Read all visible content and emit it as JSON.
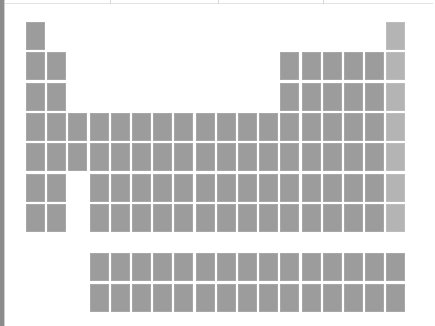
{
  "window": {
    "top_dividers_x": [
      110,
      218,
      323
    ]
  },
  "periodic_table": {
    "colors": {
      "element": "#9c9c9c",
      "noble_gas": "#b4b4b4",
      "background": "#ffffff"
    },
    "layout": {
      "x0": 26,
      "y0": 22,
      "col_pitch": 21.2,
      "row_pitch": 30.3,
      "fblock_y0": 253,
      "fblock_row_pitch": 30.5,
      "fblock_col_start": 4
    },
    "rows": [
      {
        "period": 1,
        "columns": [
          1,
          18
        ]
      },
      {
        "period": 2,
        "columns": [
          1,
          2,
          13,
          14,
          15,
          16,
          17,
          18
        ]
      },
      {
        "period": 3,
        "columns": [
          1,
          2,
          13,
          14,
          15,
          16,
          17,
          18
        ]
      },
      {
        "period": 4,
        "columns": [
          1,
          2,
          3,
          4,
          5,
          6,
          7,
          8,
          9,
          10,
          11,
          12,
          13,
          14,
          15,
          16,
          17,
          18
        ]
      },
      {
        "period": 5,
        "columns": [
          1,
          2,
          3,
          4,
          5,
          6,
          7,
          8,
          9,
          10,
          11,
          12,
          13,
          14,
          15,
          16,
          17,
          18
        ]
      },
      {
        "period": 6,
        "columns": [
          1,
          2,
          4,
          5,
          6,
          7,
          8,
          9,
          10,
          11,
          12,
          13,
          14,
          15,
          16,
          17,
          18
        ]
      },
      {
        "period": 7,
        "columns": [
          1,
          2,
          4,
          5,
          6,
          7,
          8,
          9,
          10,
          11,
          12,
          13,
          14,
          15,
          16,
          17,
          18
        ]
      }
    ],
    "f_block": [
      {
        "series": "lanthanides",
        "count": 15
      },
      {
        "series": "actinides",
        "count": 15
      }
    ]
  }
}
